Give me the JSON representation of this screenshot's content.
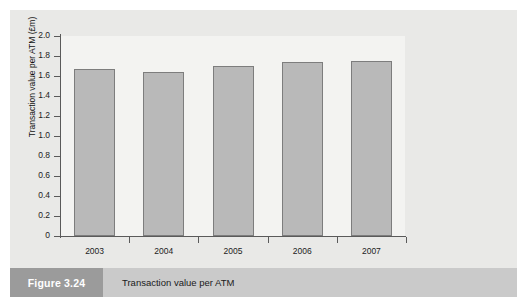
{
  "figure": {
    "number_label": "Figure 3.24",
    "caption": "Transaction value per ATM"
  },
  "colors": {
    "panel_background": "#e9e9e7",
    "plot_background": "#f3f3f1",
    "bar_fill": "#b9b9b9",
    "bar_stroke": "#7d7d7d",
    "axis": "#5a5a5a",
    "caption_number_box": "#9b9b9b",
    "caption_text_box": "#cacaca"
  },
  "chart_data": {
    "type": "bar",
    "title": "",
    "subtitle": "",
    "xlabel": "",
    "ylabel": "Transaction value per ATM (£m)",
    "categories": [
      "2003",
      "2004",
      "2005",
      "2006",
      "2007"
    ],
    "values": [
      1.67,
      1.64,
      1.7,
      1.74,
      1.75
    ],
    "series": [
      {
        "name": "Transaction value per ATM",
        "values": [
          1.67,
          1.64,
          1.7,
          1.74,
          1.75
        ]
      }
    ],
    "ylim": [
      0,
      2.0
    ],
    "ytick_labels": [
      "2.0",
      "1.8",
      "1.6",
      "1.4",
      "1.2",
      "1.0",
      "0.8",
      "0.6",
      "0.4",
      "0.2",
      "0"
    ],
    "ytick_values": [
      2.0,
      1.8,
      1.6,
      1.4,
      1.2,
      1.0,
      0.8,
      0.6,
      0.4,
      0.2,
      0
    ],
    "grid": false,
    "legend": false,
    "legend_position": "none"
  }
}
